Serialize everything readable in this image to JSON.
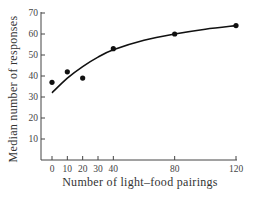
{
  "chart_data": {
    "type": "scatter",
    "title": "",
    "xlabel": "Number of light–food pairings",
    "ylabel": "Median number of responses",
    "xlim": [
      0,
      120
    ],
    "ylim": [
      0,
      70
    ],
    "x_ticks": [
      0,
      10,
      20,
      30,
      40,
      80,
      120
    ],
    "y_ticks": [
      10,
      20,
      30,
      40,
      50,
      60,
      70
    ],
    "grid": false,
    "legend": null,
    "series": [
      {
        "name": "Observed medians",
        "type": "scatter",
        "x": [
          0,
          10,
          20,
          40,
          80,
          120
        ],
        "y": [
          37,
          42,
          39,
          53,
          60,
          64
        ]
      },
      {
        "name": "Fitted curve",
        "type": "line",
        "x": [
          0,
          10,
          20,
          30,
          40,
          60,
          80,
          100,
          120
        ],
        "y": [
          32,
          39,
          44.5,
          49,
          52.5,
          57,
          60,
          62.3,
          64
        ]
      }
    ]
  }
}
